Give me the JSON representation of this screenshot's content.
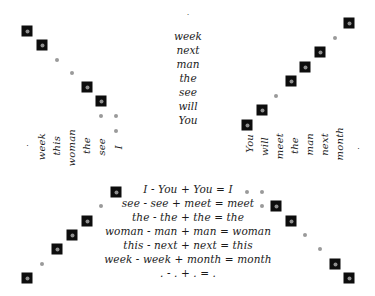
{
  "figure": {
    "title": "",
    "center_column": {
      "items": [
        ".",
        "week",
        "next",
        "man",
        "the",
        "see",
        "will",
        "You"
      ]
    },
    "left_axis": {
      "items": [
        ".",
        "week",
        "this",
        "woman",
        "the",
        "see",
        "I"
      ]
    },
    "right_axis": {
      "items": [
        "You",
        "will",
        "meet",
        "the",
        "man",
        "next",
        "month",
        "."
      ]
    },
    "equations": [
      "I - You + You = I",
      "see - see + meet = meet",
      "the - the + the = the",
      "woman - man + man = woman",
      "this - next + next = this",
      "week - week + month = month",
      ". - . + . = ."
    ],
    "colors": {
      "marker_box": "#0d0d0d",
      "marker_core": "#8e8e8e",
      "marker_dot": "#9a9a9a",
      "background": "#ffffff",
      "text": "#1a1a1a"
    },
    "markers": {
      "top_left": [
        {
          "x": 27,
          "y": 31,
          "type": "box"
        },
        {
          "x": 42,
          "y": 45,
          "type": "box"
        },
        {
          "x": 57,
          "y": 60,
          "type": "dot"
        },
        {
          "x": 72,
          "y": 73,
          "type": "dot"
        },
        {
          "x": 87,
          "y": 87,
          "type": "box"
        },
        {
          "x": 101,
          "y": 101,
          "type": "box"
        },
        {
          "x": 101,
          "y": 116,
          "type": "dot"
        },
        {
          "x": 116,
          "y": 116,
          "type": "dot"
        },
        {
          "x": 116,
          "y": 131,
          "type": "dot"
        }
      ],
      "top_right": [
        {
          "x": 349,
          "y": 23,
          "type": "box"
        },
        {
          "x": 335,
          "y": 38,
          "type": "dot"
        },
        {
          "x": 320,
          "y": 52,
          "type": "box"
        },
        {
          "x": 305,
          "y": 67,
          "type": "box"
        },
        {
          "x": 291,
          "y": 81,
          "type": "box"
        },
        {
          "x": 276,
          "y": 96,
          "type": "dot"
        },
        {
          "x": 262,
          "y": 110,
          "type": "box"
        },
        {
          "x": 247,
          "y": 125,
          "type": "box"
        }
      ],
      "bottom_left": [
        {
          "x": 116,
          "y": 192,
          "type": "box"
        },
        {
          "x": 101,
          "y": 206,
          "type": "dot"
        },
        {
          "x": 87,
          "y": 221,
          "type": "box"
        },
        {
          "x": 72,
          "y": 235,
          "type": "box"
        },
        {
          "x": 57,
          "y": 249,
          "type": "box"
        },
        {
          "x": 42,
          "y": 264,
          "type": "dot"
        },
        {
          "x": 27,
          "y": 278,
          "type": "box"
        }
      ],
      "bottom_right": [
        {
          "x": 247,
          "y": 192,
          "type": "dot"
        },
        {
          "x": 262,
          "y": 192,
          "type": "dot"
        },
        {
          "x": 262,
          "y": 206,
          "type": "dot"
        },
        {
          "x": 276,
          "y": 206,
          "type": "box"
        },
        {
          "x": 291,
          "y": 221,
          "type": "box"
        },
        {
          "x": 305,
          "y": 235,
          "type": "dot"
        },
        {
          "x": 320,
          "y": 249,
          "type": "dot"
        },
        {
          "x": 335,
          "y": 264,
          "type": "box"
        },
        {
          "x": 349,
          "y": 278,
          "type": "box"
        }
      ]
    }
  }
}
